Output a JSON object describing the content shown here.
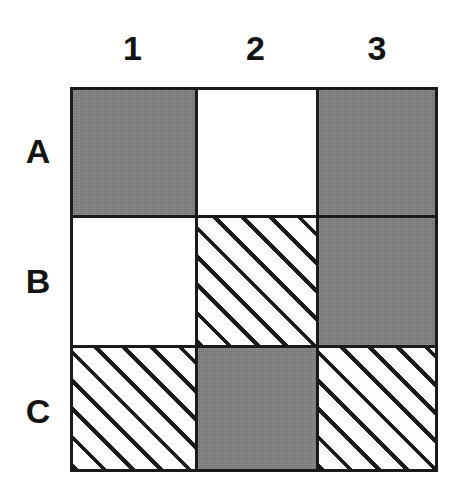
{
  "figure": {
    "kind": "3x3 shaded grid matrix",
    "column_headers": [
      "1",
      "2",
      "3"
    ],
    "row_headers": [
      "A",
      "B",
      "C"
    ]
  },
  "colors": {
    "gray_fill": "#808080",
    "white_fill": "#ffffff",
    "hatch_line": "#1a1a1a",
    "grid_line": "#1a1a1a",
    "label_text": "#141414"
  },
  "chart_data": {
    "type": "heatmap",
    "title": "",
    "xlabel": "",
    "ylabel": "",
    "grid": true,
    "legend": "none",
    "categories": [
      "1",
      "2",
      "3"
    ],
    "rows": [
      "A",
      "B",
      "C"
    ],
    "fill_legend": {
      "gray": "solid gray fill",
      "white": "empty / white fill",
      "hatch": "diagonal hatched fill (45 degree, lower-left to upper-right)"
    },
    "cells": [
      [
        {
          "row": "A",
          "col": "1",
          "fill": "gray"
        },
        {
          "row": "A",
          "col": "2",
          "fill": "white"
        },
        {
          "row": "A",
          "col": "3",
          "fill": "gray"
        }
      ],
      [
        {
          "row": "B",
          "col": "1",
          "fill": "white"
        },
        {
          "row": "B",
          "col": "2",
          "fill": "hatch"
        },
        {
          "row": "B",
          "col": "3",
          "fill": "gray"
        }
      ],
      [
        {
          "row": "C",
          "col": "1",
          "fill": "hatch"
        },
        {
          "row": "C",
          "col": "2",
          "fill": "gray"
        },
        {
          "row": "C",
          "col": "3",
          "fill": "hatch"
        }
      ]
    ]
  }
}
